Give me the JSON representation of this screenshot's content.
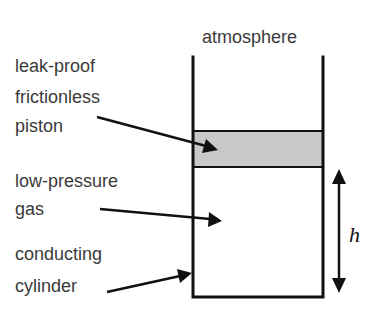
{
  "diagram": {
    "title_label": "atmosphere",
    "labels": {
      "piston": [
        "leak-proof",
        "frictionless",
        "piston"
      ],
      "gas": [
        "low-pressure",
        "gas"
      ],
      "cylinder": [
        "conducting",
        "cylinder"
      ]
    },
    "height_variable": "h",
    "colors": {
      "piston_fill": "#c8c8c8",
      "line": "#111111",
      "text": "#3a3a3a"
    }
  }
}
